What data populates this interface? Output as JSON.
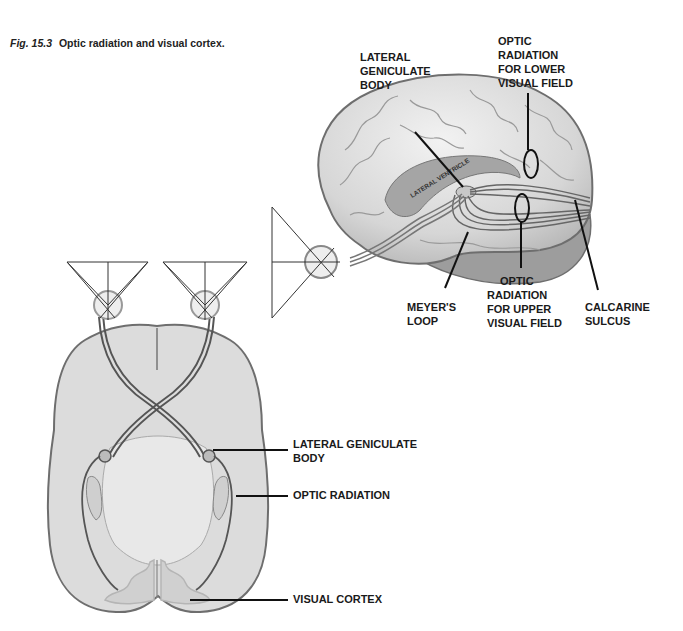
{
  "caption": {
    "figure_number": "Fig. 15.3",
    "title": "Optic radiation and visual cortex."
  },
  "lateral_view": {
    "labels": {
      "lgb": [
        "LATERAL",
        "GENICULATE",
        "BODY"
      ],
      "upper_right": [
        "OPTIC",
        "RADIATION",
        "FOR LOWER",
        "VISUAL FIELD"
      ],
      "meyers": [
        "MEYER'S",
        "LOOP"
      ],
      "upper_field": [
        "OPTIC",
        "RADIATION",
        "FOR UPPER",
        "VISUAL FIELD"
      ],
      "calcarine": [
        "CALCARINE",
        "SULCUS"
      ],
      "ventricle": "LATERAL VENTRICLE"
    }
  },
  "axial_view": {
    "labels": {
      "lgb": [
        "LATERAL GENICULATE",
        "BODY"
      ],
      "optic_radiation": "OPTIC RADIATION",
      "visual_cortex": "VISUAL CORTEX"
    }
  },
  "colors": {
    "brain_fill": "#dcdcdc",
    "brain_stroke": "#6e6e6e",
    "tract": "#555555",
    "label": "#1a1a1a"
  }
}
